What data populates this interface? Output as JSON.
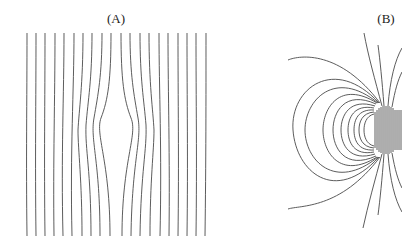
{
  "figure": {
    "panels": [
      {
        "id": "A",
        "label": "(A)",
        "description": "Uniform parallel field lines deflected around a central obstacle",
        "line_count": 20
      },
      {
        "id": "B",
        "label": "(B)",
        "description": "Dipole-like field with closed loops and radial lines around a source at the right edge"
      }
    ],
    "colors": {
      "line": "#4a4a4a",
      "background": "#ffffff"
    }
  }
}
